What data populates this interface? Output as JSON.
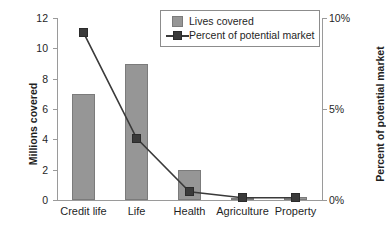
{
  "chart_data": {
    "type": "bar",
    "title": "",
    "subtitle": "",
    "categories": [
      "Credit life",
      "Life",
      "Health",
      "Agriculture",
      "Property"
    ],
    "xlabel": "",
    "ylabel": "Millions covered",
    "y2label": "Percent of potential market",
    "ylim": [
      0,
      12
    ],
    "y2lim": [
      0,
      10
    ],
    "yticks": [
      "0",
      "2",
      "4",
      "6",
      "8",
      "10",
      "12"
    ],
    "ytick_values": [
      0,
      2,
      4,
      6,
      8,
      10,
      12
    ],
    "y2ticks": [
      "0%",
      "5%",
      "10%"
    ],
    "y2tick_values": [
      0,
      5,
      10
    ],
    "grid": false,
    "legend_position": "top-right",
    "series": [
      {
        "name": "Lives covered",
        "type": "bar",
        "axis": "left",
        "unit": "millions",
        "color": "#969696",
        "values": [
          7.0,
          9.0,
          2.0,
          0.15,
          0.2
        ]
      },
      {
        "name": "Percent of potential market",
        "type": "line",
        "axis": "right",
        "unit": "percent",
        "color": "#3a3a3a",
        "values": [
          9.2,
          3.4,
          0.45,
          0.12,
          0.12
        ]
      }
    ]
  },
  "legend": {
    "items": [
      {
        "label": "Lives covered",
        "marker": "bar-swatch"
      },
      {
        "label": "Percent of potential market",
        "marker": "line-square-marker"
      }
    ]
  },
  "colors": {
    "bar_fill": "#969696",
    "bar_stroke": "#7b7b7b",
    "line": "#3a3a3a",
    "marker": "#3a3a3a",
    "axis": "#9a9a9a",
    "text": "#1f1f1f",
    "background": "#ffffff"
  }
}
